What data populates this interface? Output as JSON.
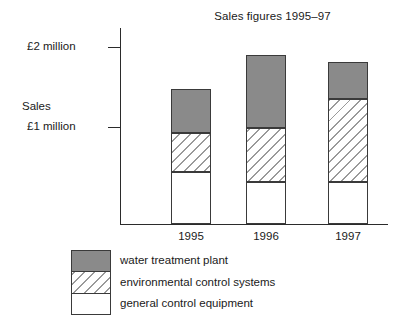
{
  "chart_data": {
    "type": "bar",
    "subtype": "stacked-bar",
    "title": "Sales figures 1995–97",
    "xlabel": "",
    "ylabel": "Sales",
    "categories": [
      "1995",
      "1996",
      "1997"
    ],
    "ytick_labels": [
      "£1 million",
      "£2 million"
    ],
    "ytick_values": [
      1.0,
      2.0
    ],
    "ylim": [
      -0.21,
      2.46
    ],
    "yunit": "£ million",
    "grid": false,
    "legend_position": "below-left",
    "series": [
      {
        "name": "general control equipment",
        "swatch": "white",
        "color": "#ffffff",
        "values": [
          0.44,
          0.52,
          0.52
        ]
      },
      {
        "name": "environmental control systems",
        "swatch": "diagonal-hatch",
        "color": "#9a9a9a",
        "values": [
          0.49,
          0.68,
          1.04
        ]
      },
      {
        "name": "water treatment plant",
        "swatch": "solid-grey",
        "color": "#8a8a8a",
        "values": [
          0.55,
          0.91,
          0.46
        ]
      }
    ],
    "totals": [
      1.48,
      2.11,
      2.02
    ],
    "annotations": []
  },
  "axis": {
    "y_tick_top_label": "£2 million",
    "y_tick_bottom_label": "£1 million",
    "y_axis_name": "Sales"
  },
  "legend": {
    "items": [
      {
        "label": "water treatment plant"
      },
      {
        "label": "environmental control systems"
      },
      {
        "label": "general control equipment"
      }
    ]
  },
  "colors": {
    "ink": "#1a1a1a",
    "axis": "#2b2b2b",
    "outline": "#3a3a3a",
    "water_fill": "#8a8a8a",
    "hatch_stroke": "#9a9a9a",
    "general_fill": "#ffffff",
    "background": "#ffffff"
  },
  "geometry": {
    "bars": [
      {
        "category": "1995",
        "left": 171,
        "top": 89,
        "split_water_env": 133,
        "split_env_gen": 172,
        "baseline": 224
      },
      {
        "category": "1996",
        "left": 246,
        "top": 55,
        "split_water_env": 128,
        "split_env_gen": 182,
        "baseline": 224
      },
      {
        "category": "1997",
        "left": 328,
        "top": 62,
        "split_water_env": 99,
        "split_env_gen": 182,
        "baseline": 224
      }
    ]
  }
}
